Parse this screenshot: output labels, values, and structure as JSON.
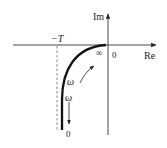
{
  "diagram": {
    "type": "nyquist-plot",
    "colors": {
      "axis": "#333333",
      "curve": "#111111",
      "dashed": "#555555",
      "text": "#222222"
    },
    "axes": {
      "x_label": "Re",
      "y_label": "Im",
      "origin_label": "0"
    },
    "marker": {
      "label": "−T"
    },
    "curve": {
      "high_freq_label": "∞",
      "low_freq_label": "0",
      "omega_label_upper": "ω",
      "omega_label_lower": "ω"
    }
  }
}
